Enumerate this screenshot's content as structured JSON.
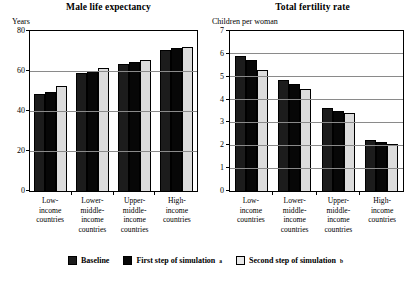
{
  "legend": {
    "items": [
      {
        "label": "Baseline",
        "note": "",
        "color": "#1c1c1c",
        "name": "baseline"
      },
      {
        "label": "First step of simulation",
        "note": "a",
        "color": "#070707",
        "name": "first-step"
      },
      {
        "label": "Second step of simulation",
        "note": "b",
        "color": "#e8e8e8",
        "name": "second-step"
      }
    ]
  },
  "chart_data": [
    {
      "type": "bar",
      "title": "Male life expectancy",
      "ylabel": "Years",
      "xlabel": "",
      "ylim": [
        0,
        80
      ],
      "yticks": [
        0,
        20,
        40,
        60,
        80
      ],
      "ytick_labels": [
        "0",
        "20",
        "40",
        "60",
        "80"
      ],
      "grid": true,
      "legend_position": "bottom",
      "categories": [
        "Low-income countries",
        "Lower-middle-income countries",
        "Upper-middle-income countries",
        "High-income countries"
      ],
      "category_lines": [
        [
          "Low-",
          "income",
          "countries"
        ],
        [
          "Lower-",
          "middle-",
          "income",
          "countries"
        ],
        [
          "Upper-",
          "middle-",
          "income",
          "countries"
        ],
        [
          "High-",
          "income",
          "countries"
        ]
      ],
      "series": [
        {
          "name": "Baseline",
          "values": [
            48.5,
            59.0,
            63.5,
            70.5
          ]
        },
        {
          "name": "First step of simulation",
          "values": [
            49.5,
            60.0,
            64.5,
            71.5
          ]
        },
        {
          "name": "Second step of simulation",
          "values": [
            52.5,
            61.5,
            65.5,
            72.0
          ]
        }
      ]
    },
    {
      "type": "bar",
      "title": "Total fertility rate",
      "ylabel": "Children per woman",
      "xlabel": "",
      "ylim": [
        0,
        7
      ],
      "yticks": [
        0,
        1,
        2,
        3,
        4,
        5,
        6,
        7
      ],
      "ytick_labels": [
        "0",
        "1",
        "2",
        "3",
        "4",
        "5",
        "6",
        "7"
      ],
      "grid": true,
      "legend_position": "bottom",
      "categories": [
        "Low-income countries",
        "Lower-middle-income countries",
        "Upper-middle-income countries",
        "High-income countries"
      ],
      "category_lines": [
        [
          "Low-",
          "income",
          "countries"
        ],
        [
          "Lower-",
          "middle-",
          "income",
          "countries"
        ],
        [
          "Upper-",
          "middle-",
          "income",
          "countries"
        ],
        [
          "High-",
          "income",
          "countries"
        ]
      ],
      "series": [
        {
          "name": "Baseline",
          "values": [
            5.9,
            4.85,
            3.65,
            2.25
          ]
        },
        {
          "name": "First step of simulation",
          "values": [
            5.75,
            4.7,
            3.5,
            2.15
          ]
        },
        {
          "name": "Second step of simulation",
          "values": [
            5.3,
            4.45,
            3.4,
            2.05
          ]
        }
      ]
    }
  ]
}
